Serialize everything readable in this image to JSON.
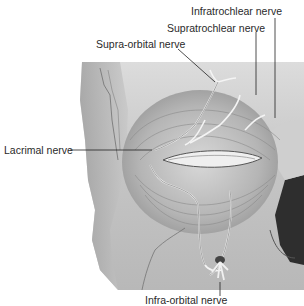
{
  "figure": {
    "labels": {
      "infratrochlear": "Infratrochlear nerve",
      "supratrochlear": "Supratrochlear nerve",
      "supraorbital": "Supra-orbital nerve",
      "lacrimal": "Lacrimal nerve",
      "infraorbital": "Infra-orbital nerve"
    }
  }
}
